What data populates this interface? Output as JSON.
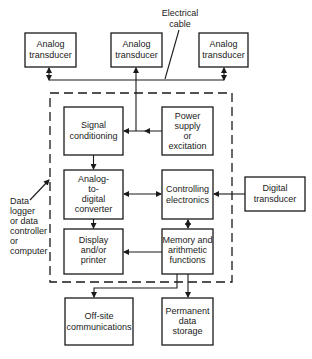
{
  "diagram": {
    "annotations": {
      "electrical_cable": [
        "Electrical",
        "cable"
      ],
      "data_logger": [
        "Data",
        "logger",
        "or data",
        "controller",
        "or",
        "computer"
      ]
    },
    "boxes": {
      "analog1": [
        "Analog",
        "transducer"
      ],
      "analog2": [
        "Analog",
        "transducer"
      ],
      "analog3": [
        "Analog",
        "transducer"
      ],
      "signal_conditioning": [
        "Signal",
        "conditioning"
      ],
      "power_supply": [
        "Power",
        "supply",
        "or",
        "excitation"
      ],
      "adc": [
        "Analog-",
        "to-",
        "digital",
        "converter"
      ],
      "controlling": [
        "Controlling",
        "electronics"
      ],
      "digital_transducer": [
        "Digital",
        "transducer"
      ],
      "display": [
        "Display",
        "and/or",
        "printer"
      ],
      "memory": [
        "Memory and",
        "arithmetic",
        "functions"
      ],
      "offsite": [
        "Off-site",
        "communications"
      ],
      "permanent": [
        "Permanent",
        "data",
        "storage"
      ]
    },
    "colors": {
      "stroke": "#1a1a1a",
      "background": "#ffffff"
    }
  }
}
